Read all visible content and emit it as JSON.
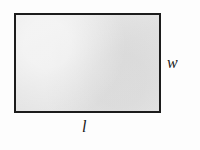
{
  "figure": {
    "kind": "geometry-diagram",
    "shape": "rectangle",
    "background_color": "#fdfdfd",
    "rectangle": {
      "fill_color": "#e4e4e4",
      "border_color": "#1c1c1c",
      "border_width_px": 2,
      "x_px": 14,
      "y_px": 13,
      "width_px": 147,
      "height_px": 100
    },
    "labels": {
      "width": {
        "text": "w",
        "meaning": "width",
        "position": "right-of-rectangle",
        "style": "italic-serif",
        "color": "#181818"
      },
      "length": {
        "text": "l",
        "meaning": "length",
        "position": "below-rectangle",
        "style": "italic-serif",
        "color": "#181818"
      }
    }
  }
}
